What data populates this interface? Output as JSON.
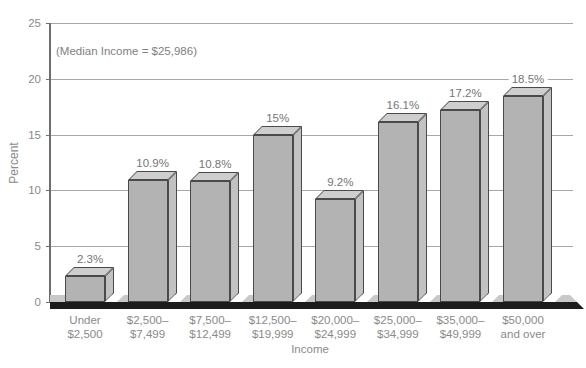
{
  "chart_data": {
    "type": "bar",
    "style": "3d",
    "annotation": "(Median Income = $25,986)",
    "xlabel": "Income",
    "ylabel": "Percent",
    "ylim": [
      0,
      25
    ],
    "yticks": [
      0,
      5,
      10,
      15,
      20,
      25
    ],
    "grid": "horizontal",
    "legend": "none",
    "categories": [
      "Under\n$2,500",
      "$2,500–\n$7,499",
      "$7,500–\n$12,499",
      "$12,500–\n$19,999",
      "$20,000–\n$24,999",
      "$25,000–\n$34,999",
      "$35,000–\n$49,999",
      "$50,000\nand over"
    ],
    "values": [
      2.3,
      10.9,
      10.8,
      15,
      9.2,
      16.1,
      17.2,
      18.5
    ],
    "bar_labels": [
      "2.3%",
      "10.9%",
      "10.8%",
      "15%",
      "9.2%",
      "16.1%",
      "17.2%",
      "18.5%"
    ],
    "colors": {
      "bar_front": "#b3b3b3",
      "bar_top": "#cecece",
      "bar_side": "#c2c2c2",
      "bar_outline": "#4a4a4a",
      "floor_top": "#c8c8c8",
      "floor_front": "#1c1c1c",
      "gridline": "#a8a8a8",
      "axis": "#6e6e6e",
      "text": "#8a8a8a"
    }
  }
}
